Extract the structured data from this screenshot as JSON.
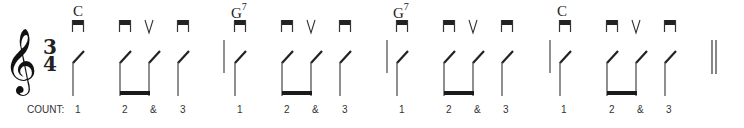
{
  "time_signature": {
    "numerator": "3",
    "denominator": "4"
  },
  "clef": "treble-clef",
  "count_label": "COUNT:",
  "measures": [
    {
      "chord": "C",
      "chord_sup": "",
      "chord_x": 73,
      "barline_x": null,
      "notes": [
        {
          "stem_x": 73,
          "bow": "down-bow",
          "count": "1",
          "count_x": 75
        },
        {
          "stem_x": 120,
          "bow": "down-bow",
          "count": "2",
          "count_x": 122
        },
        {
          "stem_x": 149,
          "bow": "up-bow",
          "count": "&",
          "count_x": 150
        },
        {
          "stem_x": 178,
          "bow": "down-bow",
          "count": "3",
          "count_x": 180
        }
      ],
      "beam": [
        120,
        149
      ]
    },
    {
      "chord": "G",
      "chord_sup": "7",
      "chord_x": 231,
      "barline_x": 224,
      "notes": [
        {
          "stem_x": 235,
          "bow": "down-bow",
          "count": "1",
          "count_x": 237
        },
        {
          "stem_x": 282,
          "bow": "down-bow",
          "count": "2",
          "count_x": 284
        },
        {
          "stem_x": 311,
          "bow": "up-bow",
          "count": "&",
          "count_x": 312
        },
        {
          "stem_x": 340,
          "bow": "down-bow",
          "count": "3",
          "count_x": 342
        }
      ],
      "beam": [
        282,
        311
      ]
    },
    {
      "chord": "G",
      "chord_sup": "7",
      "chord_x": 393,
      "barline_x": 387,
      "notes": [
        {
          "stem_x": 397,
          "bow": "down-bow",
          "count": "1",
          "count_x": 399
        },
        {
          "stem_x": 444,
          "bow": "down-bow",
          "count": "2",
          "count_x": 446
        },
        {
          "stem_x": 473,
          "bow": "up-bow",
          "count": "&",
          "count_x": 474
        },
        {
          "stem_x": 502,
          "bow": "down-bow",
          "count": "3",
          "count_x": 503
        }
      ],
      "beam": [
        444,
        473
      ]
    },
    {
      "chord": "C",
      "chord_sup": "",
      "chord_x": 557,
      "barline_x": 550,
      "notes": [
        {
          "stem_x": 560,
          "bow": "down-bow",
          "count": "1",
          "count_x": 561
        },
        {
          "stem_x": 607,
          "bow": "down-bow",
          "count": "2",
          "count_x": 609
        },
        {
          "stem_x": 636,
          "bow": "up-bow",
          "count": "&",
          "count_x": 637
        },
        {
          "stem_x": 665,
          "bow": "down-bow",
          "count": "3",
          "count_x": 666
        }
      ],
      "beam": [
        607,
        636
      ]
    }
  ],
  "final_barline": {
    "x1": 712,
    "x2": 716
  },
  "colors": {
    "ink": "#222222",
    "stem": "#444444",
    "background": "#ffffff"
  }
}
